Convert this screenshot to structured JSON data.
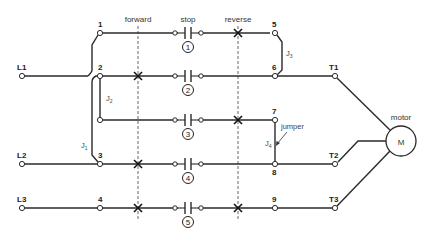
{
  "diagram": {
    "type": "motor reversing wiring diagram",
    "headers": {
      "forward": "forward",
      "stop": "stop",
      "reverse": "reverse"
    },
    "lines": {
      "L1": "L1",
      "L2": "L2",
      "L3": "L3"
    },
    "terminals": {
      "T1": "T1",
      "T2": "T2",
      "T3": "T3"
    },
    "nodes_left": [
      "1",
      "2",
      "3",
      "4"
    ],
    "nodes_right": [
      "5",
      "6",
      "7",
      "8",
      "9"
    ],
    "contacts": [
      "1",
      "2",
      "3",
      "4",
      "5"
    ],
    "jumpers": {
      "j1": "J",
      "j1_sub": "1",
      "j2": "J",
      "j2_sub": "2",
      "j3": "J",
      "j3_sub": "3",
      "j4": "J",
      "j4_sub": "4"
    },
    "jumper_callout": "jumper",
    "motor": {
      "label": "motor",
      "symbol": "M"
    }
  }
}
